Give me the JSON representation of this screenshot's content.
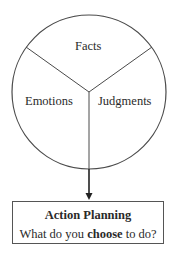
{
  "diagram": {
    "segments": [
      {
        "id": "facts",
        "label": "Facts"
      },
      {
        "id": "emotions",
        "label": "Emotions"
      },
      {
        "id": "judgments",
        "label": "Judgments"
      }
    ],
    "action_box": {
      "title": "Action Planning",
      "question_prefix": "What do you ",
      "question_emphasis": "choose",
      "question_suffix": " to do?"
    },
    "colors": {
      "line": "#4a4a4a",
      "text": "#2a2a2a",
      "background": "#ffffff"
    }
  }
}
